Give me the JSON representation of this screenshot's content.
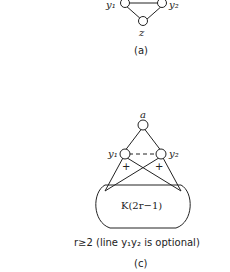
{
  "figure_a": {
    "caption": "(a)",
    "nodes": {
      "y1": "y₁",
      "y2": "y₂",
      "z": "z"
    }
  },
  "figure_c": {
    "caption": "(c)",
    "nodes": {
      "a": "a",
      "y1": "y₁",
      "y2": "y₂"
    },
    "signs": [
      "+",
      "+"
    ],
    "clique_label": "K(2r−1)",
    "condition": "r≥2 (line y₁y₂ is optional)"
  },
  "colors": {
    "stroke": "#222222",
    "background": "#ffffff"
  }
}
